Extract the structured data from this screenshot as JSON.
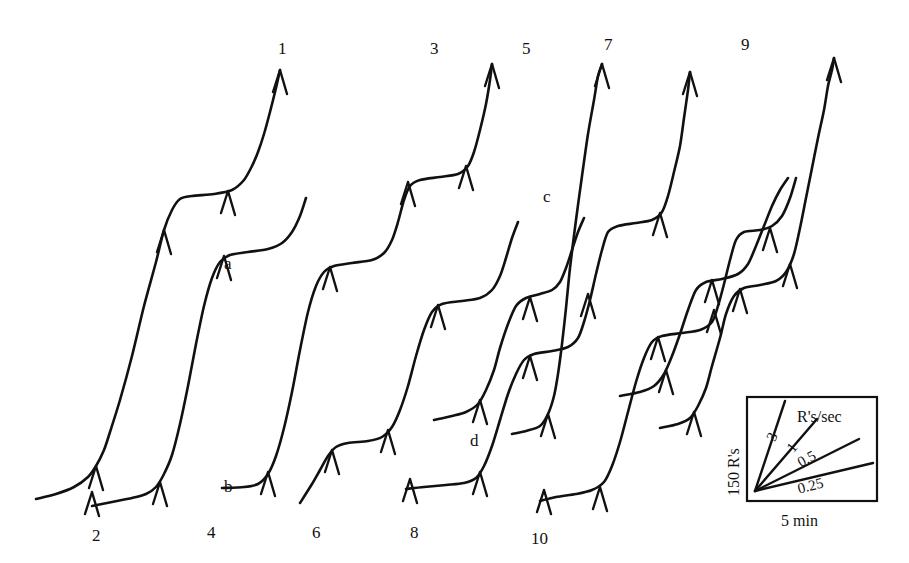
{
  "figure": {
    "type": "cumulative-record",
    "background_color": "#ffffff",
    "ink_color": "#111111",
    "width": 909,
    "height": 563
  },
  "chart_data": {
    "type": "line",
    "title": "",
    "subtitle": "",
    "xlabel": "5 min",
    "ylabel": "150 R's",
    "grid": false,
    "legend_position": "bottom-right",
    "xlim": [
      0,
      909
    ],
    "ylim": [
      0,
      563
    ],
    "axis_note": "Axes are uncalibrated drawing coordinates; scale is given by the calibration box.",
    "calibration": {
      "vertical_label": "150 R's",
      "horizontal_label": "5 min",
      "rate_header": "R's/sec",
      "rate_labels": [
        "3",
        "1",
        "0.5",
        "0.25"
      ],
      "rate_values": [
        3,
        1,
        0.5,
        0.25
      ],
      "box": {
        "x": 747,
        "y": 397,
        "width": 130,
        "height": 104
      }
    },
    "endpoint_labels": [
      "1",
      "2",
      "3",
      "4",
      "5",
      "6",
      "7",
      "8",
      "9",
      "10"
    ],
    "annotation_labels": [
      "a",
      "b",
      "c",
      "d"
    ],
    "series": [
      {
        "name": "1",
        "start_label": "",
        "end_label": "1",
        "points": [
          [
            36,
            499
          ],
          [
            56,
            494
          ],
          [
            74,
            487
          ],
          [
            88,
            477
          ],
          [
            96,
            466
          ],
          [
            104,
            450
          ],
          [
            110,
            432
          ],
          [
            120,
            400
          ],
          [
            132,
            356
          ],
          [
            144,
            306
          ],
          [
            156,
            262
          ],
          [
            164,
            230
          ],
          [
            172,
            210
          ],
          [
            180,
            199
          ],
          [
            192,
            196
          ],
          [
            214,
            194
          ],
          [
            232,
            190
          ],
          [
            244,
            180
          ],
          [
            252,
            166
          ],
          [
            258,
            152
          ],
          [
            264,
            134
          ],
          [
            270,
            112
          ],
          [
            276,
            88
          ],
          [
            280,
            70
          ]
        ],
        "event_ticks": [
          [
            96,
            466
          ],
          [
            164,
            230
          ],
          [
            228,
            191
          ],
          [
            280,
            70
          ]
        ]
      },
      {
        "name": "2",
        "start_label": "2",
        "end_label": "",
        "points": [
          [
            92,
            506
          ],
          [
            112,
            502
          ],
          [
            132,
            498
          ],
          [
            146,
            494
          ],
          [
            156,
            487
          ],
          [
            164,
            474
          ],
          [
            172,
            455
          ],
          [
            180,
            424
          ],
          [
            188,
            386
          ],
          [
            196,
            344
          ],
          [
            204,
            306
          ],
          [
            212,
            278
          ],
          [
            220,
            262
          ],
          [
            230,
            255
          ],
          [
            248,
            252
          ],
          [
            268,
            249
          ],
          [
            282,
            243
          ],
          [
            292,
            232
          ],
          [
            300,
            216
          ],
          [
            306,
            198
          ]
        ],
        "event_ticks": [
          [
            92,
            492
          ],
          [
            160,
            482
          ],
          [
            224,
            256
          ]
        ]
      },
      {
        "name": "3",
        "start_label": "4",
        "end_label": "3",
        "points": [
          [
            222,
            488
          ],
          [
            244,
            487
          ],
          [
            258,
            484
          ],
          [
            268,
            474
          ],
          [
            276,
            456
          ],
          [
            284,
            428
          ],
          [
            292,
            392
          ],
          [
            300,
            350
          ],
          [
            308,
            312
          ],
          [
            316,
            286
          ],
          [
            324,
            272
          ],
          [
            334,
            266
          ],
          [
            352,
            263
          ],
          [
            372,
            260
          ],
          [
            384,
            253
          ],
          [
            392,
            240
          ],
          [
            398,
            222
          ],
          [
            404,
            200
          ],
          [
            410,
            186
          ],
          [
            420,
            180
          ],
          [
            440,
            177
          ],
          [
            458,
            174
          ],
          [
            468,
            166
          ],
          [
            474,
            152
          ],
          [
            480,
            130
          ],
          [
            486,
            104
          ],
          [
            490,
            80
          ],
          [
            492,
            64
          ]
        ],
        "event_ticks": [
          [
            268,
            472
          ],
          [
            330,
            267
          ],
          [
            408,
            182
          ],
          [
            466,
            166
          ],
          [
            492,
            64
          ]
        ]
      },
      {
        "name": "4",
        "start_label": "6",
        "end_label": "",
        "points": [
          [
            300,
            503
          ],
          [
            312,
            484
          ],
          [
            320,
            470
          ],
          [
            328,
            456
          ],
          [
            336,
            447
          ],
          [
            348,
            443
          ],
          [
            368,
            441
          ],
          [
            382,
            437
          ],
          [
            392,
            427
          ],
          [
            400,
            410
          ],
          [
            408,
            386
          ],
          [
            416,
            356
          ],
          [
            424,
            330
          ],
          [
            432,
            312
          ],
          [
            442,
            304
          ],
          [
            462,
            301
          ],
          [
            480,
            298
          ],
          [
            492,
            290
          ],
          [
            500,
            276
          ],
          [
            506,
            258
          ],
          [
            512,
            238
          ],
          [
            518,
            222
          ]
        ],
        "event_ticks": [
          [
            332,
            450
          ],
          [
            388,
            430
          ],
          [
            438,
            305
          ]
        ]
      },
      {
        "name": "5",
        "start_label": "8",
        "end_label": "5",
        "points": [
          [
            406,
            489
          ],
          [
            424,
            487
          ],
          [
            446,
            485
          ],
          [
            464,
            483
          ],
          [
            476,
            478
          ],
          [
            484,
            466
          ],
          [
            492,
            446
          ],
          [
            500,
            420
          ],
          [
            508,
            394
          ],
          [
            516,
            374
          ],
          [
            524,
            360
          ],
          [
            534,
            354
          ],
          [
            552,
            351
          ],
          [
            568,
            347
          ],
          [
            578,
            338
          ],
          [
            584,
            322
          ],
          [
            590,
            300
          ],
          [
            596,
            274
          ],
          [
            602,
            250
          ],
          [
            608,
            232
          ],
          [
            618,
            226
          ],
          [
            636,
            223
          ],
          [
            652,
            220
          ],
          [
            662,
            212
          ],
          [
            668,
            196
          ],
          [
            674,
            172
          ],
          [
            680,
            146
          ],
          [
            684,
            118
          ],
          [
            688,
            90
          ],
          [
            690,
            72
          ]
        ],
        "event_ticks": [
          [
            410,
            479
          ],
          [
            480,
            472
          ],
          [
            530,
            356
          ],
          [
            588,
            294
          ],
          [
            660,
            213
          ],
          [
            690,
            72
          ]
        ]
      },
      {
        "name": "6",
        "start_label": "10",
        "end_label": "",
        "points": [
          [
            540,
            501
          ],
          [
            556,
            497
          ],
          [
            576,
            494
          ],
          [
            592,
            490
          ],
          [
            604,
            482
          ],
          [
            612,
            466
          ],
          [
            620,
            442
          ],
          [
            628,
            412
          ],
          [
            636,
            382
          ],
          [
            644,
            358
          ],
          [
            652,
            342
          ],
          [
            662,
            336
          ],
          [
            682,
            333
          ],
          [
            700,
            330
          ],
          [
            712,
            322
          ],
          [
            718,
            306
          ],
          [
            724,
            284
          ],
          [
            730,
            260
          ],
          [
            736,
            240
          ],
          [
            744,
            232
          ],
          [
            760,
            230
          ],
          [
            772,
            226
          ],
          [
            782,
            216
          ],
          [
            790,
            198
          ],
          [
            796,
            178
          ]
        ],
        "event_ticks": [
          [
            544,
            490
          ],
          [
            600,
            487
          ],
          [
            658,
            337
          ],
          [
            714,
            310
          ],
          [
            770,
            228
          ]
        ]
      },
      {
        "name": "7",
        "start_label": "",
        "end_label": "7",
        "points": [
          [
            512,
            434
          ],
          [
            526,
            431
          ],
          [
            540,
            426
          ],
          [
            548,
            414
          ],
          [
            554,
            396
          ],
          [
            558,
            374
          ],
          [
            562,
            344
          ],
          [
            566,
            308
          ],
          [
            570,
            268
          ],
          [
            576,
            220
          ],
          [
            582,
            176
          ],
          [
            588,
            134
          ],
          [
            594,
            100
          ],
          [
            598,
            76
          ],
          [
            602,
            64
          ]
        ],
        "event_ticks": [
          [
            548,
            414
          ],
          [
            602,
            64
          ]
        ]
      },
      {
        "name": "8",
        "start_label": "",
        "end_label": "",
        "points": [
          [
            434,
            420
          ],
          [
            452,
            416
          ],
          [
            466,
            412
          ],
          [
            478,
            404
          ],
          [
            486,
            390
          ],
          [
            494,
            370
          ],
          [
            500,
            348
          ],
          [
            508,
            324
          ],
          [
            516,
            306
          ],
          [
            526,
            298
          ],
          [
            540,
            294
          ],
          [
            552,
            290
          ],
          [
            560,
            282
          ],
          [
            566,
            268
          ],
          [
            572,
            250
          ],
          [
            578,
            232
          ],
          [
            584,
            218
          ]
        ],
        "event_ticks": [
          [
            480,
            400
          ],
          [
            530,
            297
          ]
        ]
      },
      {
        "name": "9",
        "start_label": "",
        "end_label": "9",
        "points": [
          [
            660,
            428
          ],
          [
            678,
            424
          ],
          [
            690,
            418
          ],
          [
            698,
            406
          ],
          [
            706,
            388
          ],
          [
            712,
            366
          ],
          [
            720,
            338
          ],
          [
            726,
            314
          ],
          [
            734,
            296
          ],
          [
            744,
            288
          ],
          [
            760,
            285
          ],
          [
            776,
            281
          ],
          [
            786,
            272
          ],
          [
            794,
            254
          ],
          [
            800,
            228
          ],
          [
            806,
            198
          ],
          [
            812,
            168
          ],
          [
            818,
            138
          ],
          [
            824,
            110
          ],
          [
            828,
            86
          ],
          [
            832,
            70
          ],
          [
            834,
            58
          ]
        ],
        "event_ticks": [
          [
            694,
            412
          ],
          [
            740,
            289
          ],
          [
            790,
            264
          ],
          [
            834,
            58
          ]
        ]
      },
      {
        "name": "10",
        "start_label": "",
        "end_label": "",
        "points": [
          [
            620,
            396
          ],
          [
            640,
            392
          ],
          [
            654,
            386
          ],
          [
            664,
            374
          ],
          [
            672,
            356
          ],
          [
            680,
            334
          ],
          [
            688,
            310
          ],
          [
            696,
            290
          ],
          [
            706,
            282
          ],
          [
            722,
            279
          ],
          [
            738,
            274
          ],
          [
            748,
            264
          ],
          [
            756,
            246
          ],
          [
            764,
            226
          ],
          [
            772,
            206
          ],
          [
            780,
            190
          ],
          [
            788,
            178
          ]
        ],
        "event_ticks": [
          [
            666,
            370
          ],
          [
            712,
            280
          ]
        ]
      }
    ],
    "endpoints": [
      {
        "label": "1",
        "x": 278,
        "y": 40,
        "position": "top"
      },
      {
        "label": "3",
        "x": 430,
        "y": 40,
        "position": "top"
      },
      {
        "label": "5",
        "x": 522,
        "y": 40,
        "position": "top"
      },
      {
        "label": "7",
        "x": 604,
        "y": 36,
        "position": "top"
      },
      {
        "label": "9",
        "x": 741,
        "y": 36,
        "position": "top"
      },
      {
        "label": "2",
        "x": 92,
        "y": 527,
        "position": "bottom"
      },
      {
        "label": "4",
        "x": 207,
        "y": 524,
        "position": "bottom"
      },
      {
        "label": "6",
        "x": 312,
        "y": 524,
        "position": "bottom"
      },
      {
        "label": "8",
        "x": 410,
        "y": 524,
        "position": "bottom"
      },
      {
        "label": "10",
        "x": 531,
        "y": 530,
        "position": "bottom"
      }
    ],
    "annotations": [
      {
        "label": "a",
        "x": 224,
        "y": 255
      },
      {
        "label": "b",
        "x": 224,
        "y": 478
      },
      {
        "label": "c",
        "x": 543,
        "y": 188
      },
      {
        "label": "d",
        "x": 470,
        "y": 432
      }
    ]
  }
}
